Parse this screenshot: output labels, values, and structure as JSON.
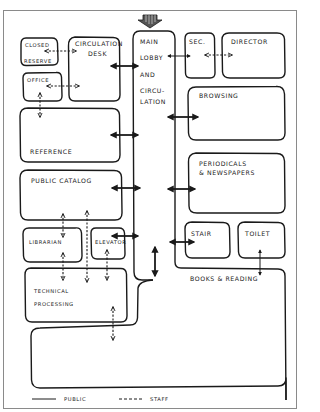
{
  "diagram": {
    "entrance_marker": "entrance-arrow",
    "rooms": {
      "closed_reserve": {
        "line1": "CLOSED",
        "line2": "RESERVE"
      },
      "circulation_desk": {
        "line1": "CIRCULATION",
        "line2": "DESK"
      },
      "main_lobby": {
        "line1": "MAIN",
        "line2": "LOBBY",
        "line3": "AND",
        "line4": "CIRCU-",
        "line5": "LATION"
      },
      "sec": {
        "label": "SEC."
      },
      "director": {
        "label": "DIRECTOR"
      },
      "office": {
        "label": "OFFICE"
      },
      "browsing": {
        "label": "BROWSING"
      },
      "reference": {
        "label": "REFERENCE"
      },
      "periodicals": {
        "line1": "PERIODICALS",
        "line2": "& NEWSPAPERS"
      },
      "public_catalog": {
        "label": "PUBLIC CATALOG"
      },
      "stair": {
        "label": "STAIR"
      },
      "toilet": {
        "label": "TOILET"
      },
      "librarian": {
        "label": "LIBRARIAN"
      },
      "elevator": {
        "label": "ELEVATOR"
      },
      "technical_processing": {
        "line1": "TECHNICAL",
        "line2": "PROCESSING"
      },
      "books_reading": {
        "label": "BOOKS & READING"
      }
    },
    "legend": {
      "public": {
        "label": "PUBLIC",
        "style": "solid"
      },
      "staff": {
        "label": "STAFF",
        "style": "dashed"
      }
    },
    "colors": {
      "ink": "#1a1a1a",
      "paper": "#ffffff",
      "frame": "#8a8a8a"
    }
  }
}
